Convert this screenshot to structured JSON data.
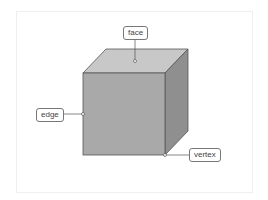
{
  "diagram": {
    "labels": {
      "face": "face",
      "edge": "edge",
      "vertex": "vertex"
    },
    "colors": {
      "front_face": "#a9a9a9",
      "top_face": "#c8c8c8",
      "right_face": "#8f8f8f",
      "outline": "#555555",
      "leader_line": "#555555",
      "label_border": "#777777",
      "frame_border": "#efefef"
    }
  }
}
